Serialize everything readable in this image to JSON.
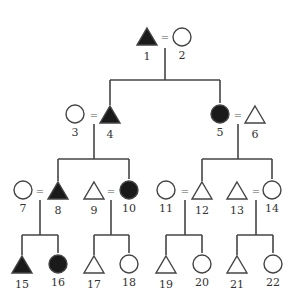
{
  "diagram": {
    "type": "pedigree",
    "legend_note": "triangle = male, circle = female, filled = affected",
    "marriage_symbol": "=",
    "individuals": [
      {
        "id": "1",
        "shape": "triangle",
        "filled": true,
        "x": 147,
        "y": 38
      },
      {
        "id": "2",
        "shape": "circle",
        "filled": false,
        "x": 182,
        "y": 37
      },
      {
        "id": "3",
        "shape": "circle",
        "filled": false,
        "x": 75,
        "y": 114
      },
      {
        "id": "4",
        "shape": "triangle",
        "filled": true,
        "x": 110,
        "y": 116
      },
      {
        "id": "5",
        "shape": "circle",
        "filled": true,
        "x": 220,
        "y": 114
      },
      {
        "id": "6",
        "shape": "triangle",
        "filled": false,
        "x": 255,
        "y": 116
      },
      {
        "id": "7",
        "shape": "circle",
        "filled": false,
        "x": 23,
        "y": 190
      },
      {
        "id": "8",
        "shape": "triangle",
        "filled": true,
        "x": 58,
        "y": 192
      },
      {
        "id": "9",
        "shape": "triangle",
        "filled": false,
        "x": 94,
        "y": 192
      },
      {
        "id": "10",
        "shape": "circle",
        "filled": true,
        "x": 129,
        "y": 190
      },
      {
        "id": "11",
        "shape": "circle",
        "filled": false,
        "x": 166,
        "y": 190
      },
      {
        "id": "12",
        "shape": "triangle",
        "filled": false,
        "x": 202,
        "y": 192
      },
      {
        "id": "13",
        "shape": "triangle",
        "filled": false,
        "x": 237,
        "y": 192
      },
      {
        "id": "14",
        "shape": "circle",
        "filled": false,
        "x": 272,
        "y": 190
      },
      {
        "id": "15",
        "shape": "triangle",
        "filled": true,
        "x": 22,
        "y": 266
      },
      {
        "id": "16",
        "shape": "circle",
        "filled": true,
        "x": 58,
        "y": 264
      },
      {
        "id": "17",
        "shape": "triangle",
        "filled": false,
        "x": 94,
        "y": 266
      },
      {
        "id": "18",
        "shape": "circle",
        "filled": false,
        "x": 129,
        "y": 264
      },
      {
        "id": "19",
        "shape": "triangle",
        "filled": false,
        "x": 166,
        "y": 266
      },
      {
        "id": "20",
        "shape": "circle",
        "filled": false,
        "x": 202,
        "y": 264
      },
      {
        "id": "21",
        "shape": "triangle",
        "filled": false,
        "x": 237,
        "y": 266
      },
      {
        "id": "22",
        "shape": "circle",
        "filled": false,
        "x": 273,
        "y": 264
      }
    ],
    "couples": [
      {
        "a": "1",
        "b": "2",
        "eq_x": 165,
        "eq_y": 38,
        "stem_x": 165,
        "stem_top": 48,
        "stem_bottom": 80
      },
      {
        "a": "3",
        "b": "4",
        "eq_x": 94,
        "eq_y": 116,
        "stem_x": 94,
        "stem_top": 124,
        "stem_bottom": 159
      },
      {
        "a": "5",
        "b": "6",
        "eq_x": 238,
        "eq_y": 116,
        "stem_x": 238,
        "stem_top": 124,
        "stem_bottom": 159
      },
      {
        "a": "7",
        "b": "8",
        "eq_x": 40,
        "eq_y": 192,
        "stem_x": 40,
        "stem_top": 200,
        "stem_bottom": 235
      },
      {
        "a": "9",
        "b": "10",
        "eq_x": 111,
        "eq_y": 192,
        "stem_x": 111,
        "stem_top": 200,
        "stem_bottom": 235
      },
      {
        "a": "11",
        "b": "12",
        "eq_x": 185,
        "eq_y": 192,
        "stem_x": 185,
        "stem_top": 200,
        "stem_bottom": 235
      },
      {
        "a": "13",
        "b": "14",
        "eq_x": 256,
        "eq_y": 192,
        "stem_x": 256,
        "stem_top": 200,
        "stem_bottom": 235
      }
    ],
    "sibships": [
      {
        "y": 80,
        "x1": 110,
        "x2": 220,
        "children": [
          "4",
          "5"
        ]
      },
      {
        "y": 159,
        "x1": 58,
        "x2": 129,
        "children": [
          "8",
          "10"
        ]
      },
      {
        "y": 159,
        "x1": 202,
        "x2": 272,
        "children": [
          "12",
          "14"
        ]
      },
      {
        "y": 235,
        "x1": 22,
        "x2": 58,
        "children": [
          "15",
          "16"
        ]
      },
      {
        "y": 235,
        "x1": 94,
        "x2": 129,
        "children": [
          "17",
          "18"
        ]
      },
      {
        "y": 235,
        "x1": 166,
        "x2": 202,
        "children": [
          "19",
          "20"
        ]
      },
      {
        "y": 235,
        "x1": 237,
        "x2": 273,
        "children": [
          "21",
          "22"
        ]
      }
    ],
    "colors": {
      "line": "#444444",
      "fill": "#1a1a1a",
      "label": "#333333"
    }
  }
}
